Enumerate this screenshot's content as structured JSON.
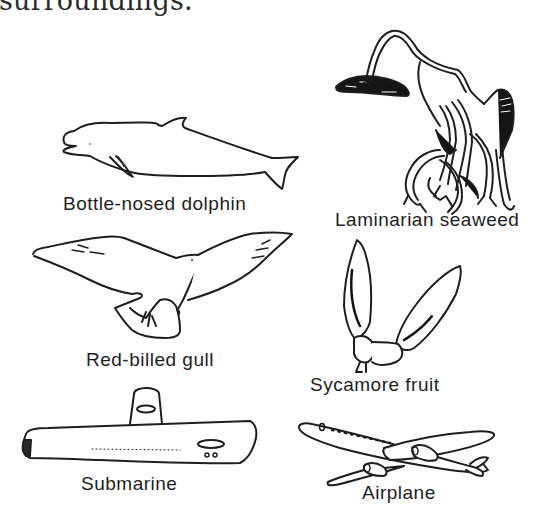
{
  "page": {
    "top_text": "surroundings."
  },
  "figures": [
    {
      "id": "dolphin",
      "label": "Bottle-nosed dolphin",
      "icon": "dolphin-icon"
    },
    {
      "id": "seaweed",
      "label": "Laminarian seaweed",
      "icon": "seaweed-icon"
    },
    {
      "id": "gull",
      "label": "Red-billed gull",
      "icon": "gull-icon"
    },
    {
      "id": "sycamore",
      "label": "Sycamore fruit",
      "icon": "sycamore-fruit-icon"
    },
    {
      "id": "submarine",
      "label": "Submarine",
      "icon": "submarine-icon"
    },
    {
      "id": "airplane",
      "label": "Airplane",
      "icon": "airplane-icon"
    }
  ],
  "colors": {
    "ink": "#1e1e1e",
    "background": "#ffffff"
  }
}
